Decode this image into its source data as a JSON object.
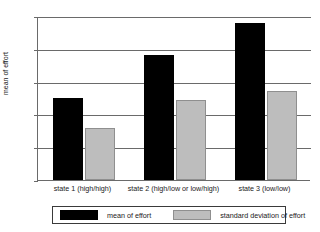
{
  "chart_data": {
    "type": "bar",
    "title": "",
    "xlabel": "",
    "ylabel": "mean of effort",
    "categories": [
      "state 1 (high/high)",
      "state 2 (high/low or low/high)",
      "state 3 (low/low)"
    ],
    "series": [
      {
        "name": "mean of effort",
        "color": "#000000",
        "values": [
          25,
          38,
          48
        ]
      },
      {
        "name": "standard deviation of effort",
        "color": "#bdbdbd",
        "values": [
          16,
          24.5,
          27
        ]
      }
    ],
    "ylim": [
      0,
      50
    ],
    "yticks": [
      0,
      10,
      20,
      30,
      40,
      50
    ],
    "ytick_labels": [
      "0",
      "10",
      "20",
      "30",
      "40",
      "50"
    ],
    "grid": true,
    "legend_position": "bottom"
  },
  "legend": {
    "entries": [
      {
        "label": "mean of effort"
      },
      {
        "label": "standard deviation of effort"
      }
    ]
  }
}
